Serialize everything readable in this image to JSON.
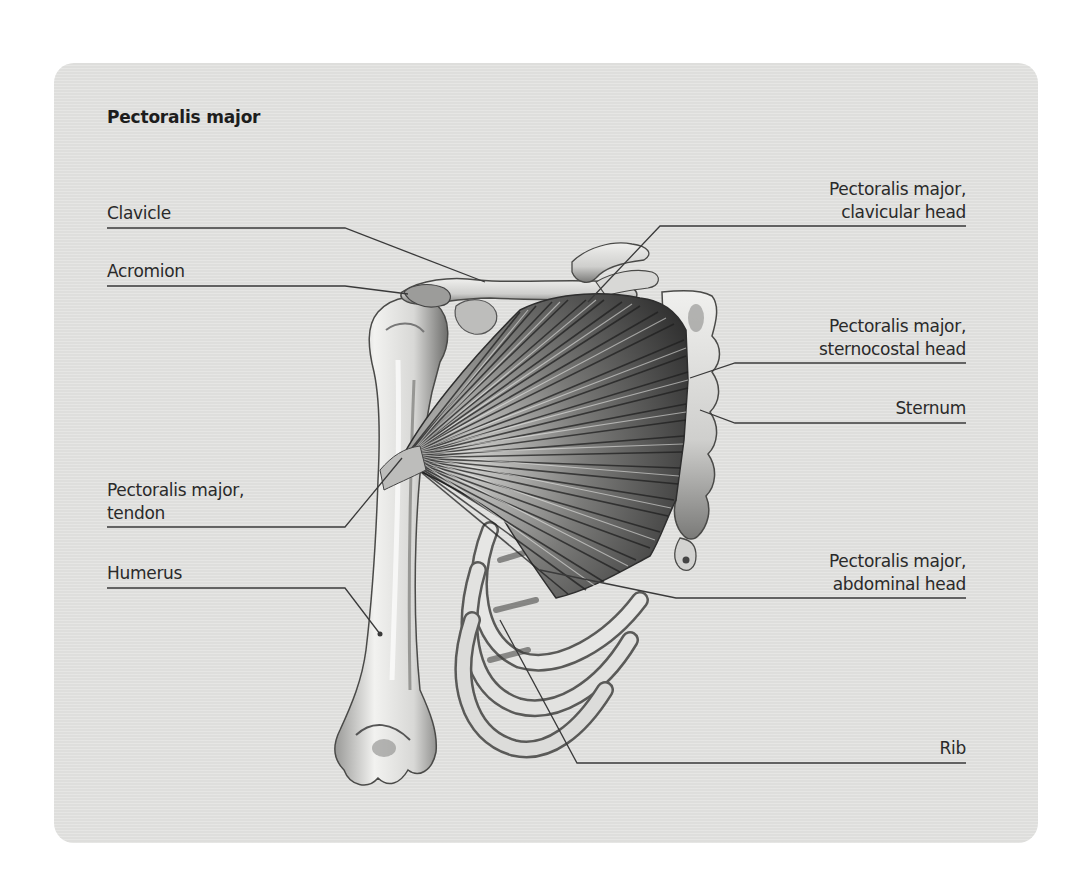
{
  "diagram": {
    "title": "Pectoralis major",
    "background_color": "#e3e3e1",
    "line_color": "#3a3a3a",
    "labels": {
      "clavicle": {
        "lines": [
          "Clavicle"
        ]
      },
      "acromion": {
        "lines": [
          "Acromion"
        ]
      },
      "tendon": {
        "lines": [
          "Pectoralis major,",
          "tendon"
        ]
      },
      "humerus": {
        "lines": [
          "Humerus"
        ]
      },
      "clavicular_head": {
        "lines": [
          "Pectoralis major,",
          "clavicular head"
        ]
      },
      "sternocostal_head": {
        "lines": [
          "Pectoralis major,",
          "sternocostal head"
        ]
      },
      "sternum": {
        "lines": [
          "Sternum"
        ]
      },
      "abdominal_head": {
        "lines": [
          "Pectoralis major,",
          "abdominal head"
        ]
      },
      "rib": {
        "lines": [
          "Rib"
        ]
      }
    }
  }
}
